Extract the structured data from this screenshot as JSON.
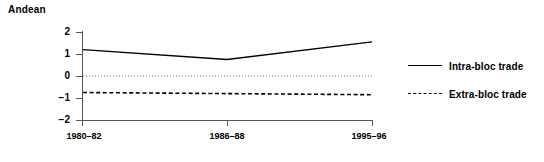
{
  "chart_data": {
    "type": "line",
    "title": "Andean",
    "xlabel": "",
    "ylabel": "",
    "categories": [
      "1980–82",
      "1986–88",
      "1995–96"
    ],
    "series": [
      {
        "name": "Intra-bloc trade",
        "style": "solid",
        "values": [
          1.2,
          0.75,
          1.55
        ]
      },
      {
        "name": "Extra-bloc trade",
        "style": "dashed",
        "values": [
          -0.75,
          -0.8,
          -0.85
        ]
      }
    ],
    "zero_reference_line": {
      "value": 0,
      "style": "dotted"
    },
    "ylim": [
      -2,
      2
    ],
    "yticks": [
      "2",
      "1",
      "0",
      "−1",
      "−2"
    ],
    "ytick_values": [
      2,
      1,
      0,
      -1,
      -2
    ],
    "grid": false,
    "legend_position": "right",
    "line_color": "#000000"
  },
  "legend": {
    "entries": [
      {
        "label": "Intra-bloc trade"
      },
      {
        "label": "Extra-bloc trade"
      }
    ]
  }
}
